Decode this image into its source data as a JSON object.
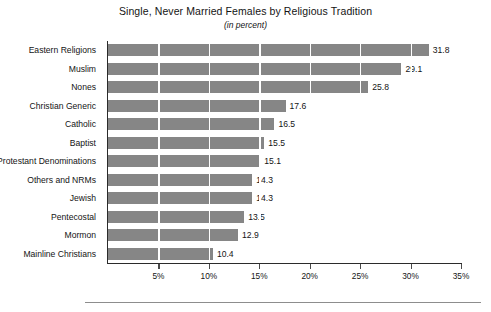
{
  "chart_data": {
    "type": "bar",
    "orientation": "horizontal",
    "title": "Single, Never Married Females by Religious Tradition",
    "subtitle": "(in percent)",
    "xlabel": "",
    "ylabel": "",
    "xlim": [
      0,
      35
    ],
    "grid": true,
    "legend": null,
    "xtick_labels": [
      "5%",
      "10%",
      "15%",
      "20%",
      "25%",
      "30%",
      "35%"
    ],
    "xtick_values": [
      5,
      10,
      15,
      20,
      25,
      30,
      35
    ],
    "bar_color": "#868686",
    "categories": [
      "Eastern Religions",
      "Muslim",
      "Nones",
      "Christian Generic",
      "Catholic",
      "Baptist",
      "Protestant Denominations",
      "Others and NRMs",
      "Jewish",
      "Pentecostal",
      "Mormon",
      "Mainline Christians"
    ],
    "values": [
      31.8,
      29.1,
      25.8,
      17.6,
      16.5,
      15.5,
      15.1,
      14.3,
      14.3,
      13.5,
      12.9,
      10.4
    ],
    "value_labels": [
      "31.8",
      "29.1",
      "25.8",
      "17.6",
      "16.5",
      "15.5",
      "15.1",
      "14.3",
      "14.3",
      "13.5",
      "12.9",
      "10.4"
    ]
  }
}
